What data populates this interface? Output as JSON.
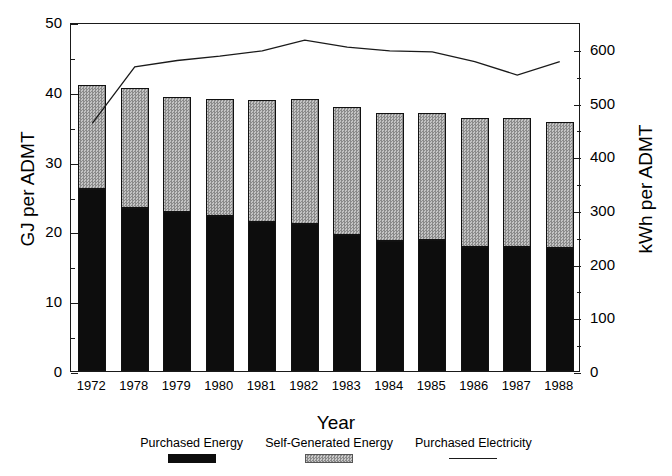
{
  "chart_data": {
    "type": "bar",
    "title": "",
    "xlabel": "Year",
    "ylabel": "GJ per ADMT",
    "ylabel_right": "kWh per ADMT",
    "categories": [
      "1972",
      "1978",
      "1979",
      "1980",
      "1981",
      "1982",
      "1983",
      "1984",
      "1985",
      "1986",
      "1987",
      "1988"
    ],
    "ylim": [
      0,
      50
    ],
    "ylim_right": [
      0,
      650
    ],
    "yticks": [
      "0",
      "10",
      "20",
      "30",
      "40",
      "50"
    ],
    "yticks_right": [
      "0",
      "100",
      "200",
      "300",
      "400",
      "500",
      "600"
    ],
    "ytick_values": [
      0,
      10,
      20,
      30,
      40,
      50
    ],
    "ytick_right_values": [
      0,
      100,
      200,
      300,
      400,
      500,
      600
    ],
    "minor_tick_step": 5,
    "minor_tick_step_right": 50,
    "grid": false,
    "stacked": true,
    "legend_position": "bottom",
    "series": [
      {
        "name": "Purchased Energy",
        "type": "bar",
        "axis": "left",
        "unit": "GJ per ADMT",
        "color": "#0d0d0d",
        "values": [
          26.1,
          23.3,
          22.8,
          22.2,
          21.3,
          21.0,
          19.5,
          18.6,
          18.7,
          17.8,
          17.7,
          17.6
        ]
      },
      {
        "name": "Self-Generated Energy",
        "type": "bar",
        "axis": "left",
        "unit": "GJ per ADMT",
        "color": "#b4b4b4",
        "values": [
          14.9,
          17.3,
          16.4,
          16.8,
          17.5,
          17.9,
          18.3,
          18.4,
          18.3,
          18.5,
          18.6,
          18.1
        ]
      },
      {
        "name": "Total Energy",
        "type": "bar-total",
        "axis": "left",
        "unit": "GJ per ADMT",
        "values": [
          41.0,
          40.6,
          39.2,
          39.0,
          38.8,
          38.9,
          37.8,
          37.0,
          37.0,
          36.3,
          36.3,
          35.7
        ]
      },
      {
        "name": "Purchased Electricity",
        "type": "line",
        "axis": "right",
        "unit": "kWh per ADMT",
        "color": "#1a1a1a",
        "values": [
          465,
          570,
          582,
          590,
          600,
          620,
          607,
          600,
          598,
          580,
          555,
          580
        ]
      }
    ]
  },
  "legend": {
    "items": [
      {
        "label": "Purchased Energy",
        "swatch": "black-fill"
      },
      {
        "label": "Self-Generated Energy",
        "swatch": "gray-hatch"
      },
      {
        "label": "Purchased Electricity",
        "swatch": "line"
      }
    ]
  },
  "caption": {
    "text": ""
  }
}
